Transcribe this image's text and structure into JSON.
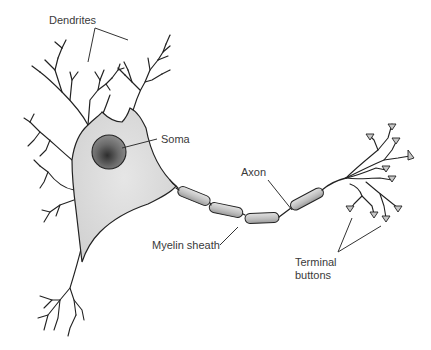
{
  "diagram": {
    "labels": {
      "dendrites": "Dendrites",
      "soma": "Soma",
      "axon": "Axon",
      "myelin_sheath": "Myelin sheath",
      "terminal_buttons_line1": "Terminal",
      "terminal_buttons_line2": "buttons"
    },
    "colors": {
      "cell_body_fill": "#d8d8d8",
      "nucleus_fill": "#6e6e6e",
      "myelin_fill": "#c8c8c8",
      "outline": "#222222",
      "label_text": "#3a3a3a",
      "background": "#ffffff"
    }
  }
}
